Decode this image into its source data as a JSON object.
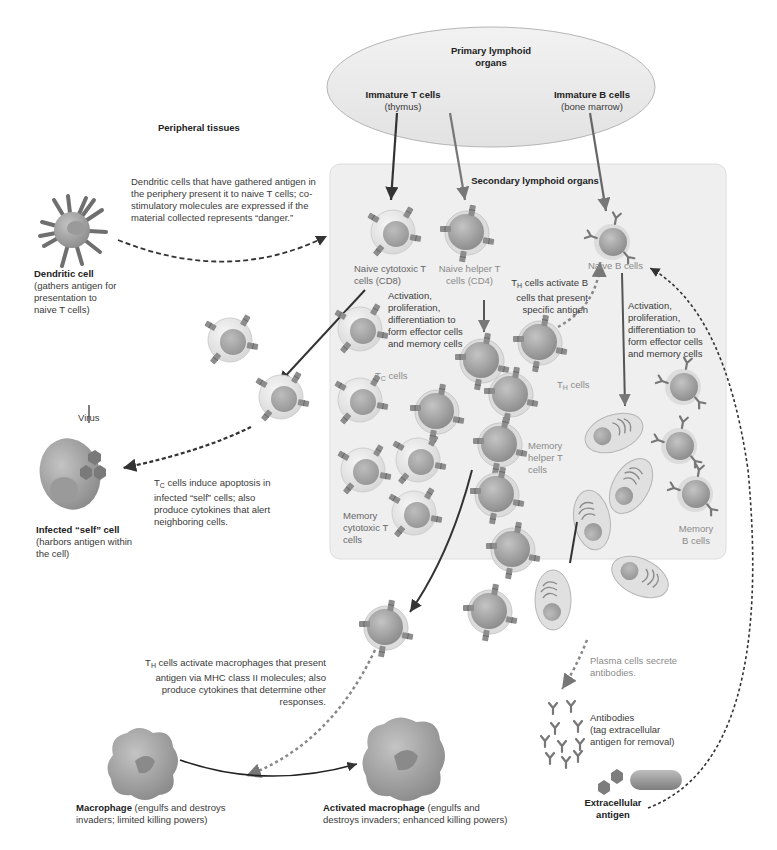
{
  "primary_organs": {
    "title": "Primary lymphoid organs",
    "immature_t": {
      "name": "Immature T cells",
      "site": "(thymus)"
    },
    "immature_b": {
      "name": "Immature B cells",
      "site": "(bone marrow)"
    }
  },
  "peripheral_tissues": {
    "title": "Peripheral tissues"
  },
  "secondary_organs": {
    "title": "Secondary lymphoid organs"
  },
  "dendritic": {
    "name": "Dendritic cell",
    "desc": "(gathers antigen for presentation to naive T cells)",
    "note": "Dendritic cells that have gathered antigen in the periphery present it to naive T cells; co-stimulatory molecules are expressed if the material collected represents “danger.”"
  },
  "naive_tc": {
    "label": "Naive cytotoxic T cells (CD8)"
  },
  "naive_th": {
    "label": "Naive helper T cells (CD4)"
  },
  "naive_b": {
    "label": "Naive B cells"
  },
  "activation_t": {
    "text": "Activation, proliferation, differentiation to form effector cells and memory cells"
  },
  "activation_b": {
    "text": "Activation, proliferation, differentiation to form effector cells and memory cells"
  },
  "th_activate_b": {
    "prefix": "T",
    "sub": "H",
    "text": " cells activate B cells that present specific antigen"
  },
  "tc_cells": {
    "prefix": "T",
    "sub": "C",
    "text": " cells"
  },
  "th_cells": {
    "prefix": "T",
    "sub": "H",
    "text": " cells"
  },
  "memory_tc": {
    "label": "Memory cytotoxic T cells"
  },
  "memory_th": {
    "label": "Memory helper T cells"
  },
  "memory_b": {
    "label": "Memory B cells"
  },
  "virus": {
    "label": "Virus"
  },
  "infected": {
    "name": "Infected “self” cell",
    "desc": "(harbors antigen within the cell)"
  },
  "tc_apoptosis": {
    "prefix": "T",
    "sub": "C",
    "text": " cells induce apoptosis in infected “self” cells; also produce cytokines that alert neighboring cells."
  },
  "th_macrophage": {
    "prefix": "T",
    "sub": "H",
    "text": " cells activate macrophages that present antigen via MHC class II molecules; also produce cytokines that determine other responses."
  },
  "plasma": {
    "text": "Plasma cells secrete antibodies."
  },
  "antibodies": {
    "name": "Antibodies",
    "desc": "(tag extracellular antigen for removal)"
  },
  "macrophage": {
    "name": "Macrophage",
    "desc": " (engulfs and destroys invaders; limited killing powers)"
  },
  "activated_macrophage": {
    "name": "Activated macrophage",
    "desc": " (engulfs and destroys invaders; enhanced killing powers)"
  },
  "extracellular": {
    "name": "Extracellular antigen"
  },
  "colors": {
    "ellipse_fill": "#ececec",
    "box_fill": "#eeeeee",
    "cell_dark": "#8c8c8c",
    "cell_light": "#e4e4e4",
    "receptor": "#8a8a8a",
    "arrow": "#333333",
    "label_gray": "#8a8a8a"
  }
}
